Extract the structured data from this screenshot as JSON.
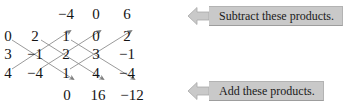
{
  "figure": {
    "kind": "determinant-diagonal-method",
    "matrix_rows": [
      [
        "0",
        "2",
        "1",
        "0",
        "2"
      ],
      [
        "3",
        "−1",
        "2",
        "3",
        "−1"
      ],
      [
        "4",
        "−4",
        "1",
        "4",
        "−4"
      ]
    ],
    "top_results": [
      "−4",
      "0",
      "6"
    ],
    "bottom_results": [
      "0",
      "16",
      "−12"
    ]
  },
  "callouts": {
    "top": {
      "label": "Subtract these products.",
      "arrow_icon": "arrow-left-icon"
    },
    "bottom": {
      "label": "Add these products.",
      "arrow_icon": "arrow-left-icon"
    }
  },
  "colors": {
    "text": "#141414",
    "banner_fill": "#c9c9c9",
    "banner_border": "#b3b3b3",
    "diagonal_line": "#8a8a8a",
    "background": "#ffffff"
  },
  "layout": {
    "column_x": [
      8,
      35,
      66,
      96,
      127
    ],
    "row_y": [
      36,
      54,
      73
    ],
    "top_result_y": 14,
    "bottom_result_y": 95
  }
}
